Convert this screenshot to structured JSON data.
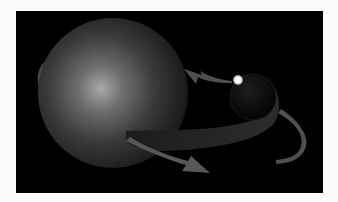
{
  "figure": {
    "background_color": "#000000",
    "page_color": "#fbfbfb",
    "elements": {
      "large_star": {
        "label": "large-star",
        "cx": 97,
        "cy": 82,
        "r": 75
      },
      "companion": {
        "label": "companion-star",
        "cx": 237,
        "cy": 86,
        "r": 23
      },
      "hotspot": {
        "label": "hotspot",
        "cx": 222,
        "cy": 69,
        "r": 5
      },
      "arrows": [
        "orbit-arrow-left",
        "orbit-arrow-bottom",
        "orbit-arrow-top",
        "orbit-arrow-right"
      ]
    }
  }
}
